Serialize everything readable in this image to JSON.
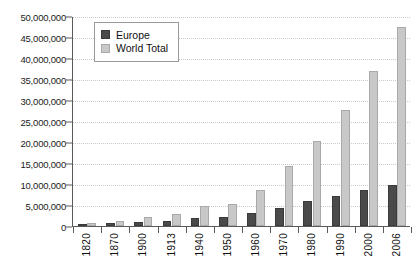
{
  "chart_data": {
    "type": "bar",
    "title": "",
    "subtitle": "",
    "xlabel": "",
    "ylabel": "",
    "ylim": [
      0,
      50000000
    ],
    "ytick_step": 5000000,
    "grid": true,
    "legend_position": "top-left",
    "categories": [
      "1820",
      "1870",
      "1900",
      "1913",
      "1940",
      "1950",
      "1960",
      "1970",
      "1980",
      "1990",
      "2000",
      "2006"
    ],
    "ytick_labels": [
      "50,000,000",
      "45,000,000",
      "40,000,000",
      "35,000,000",
      "30,000,000",
      "25,000,000",
      "20,000,000",
      "15,000,000",
      "10,000,000",
      "5,000,000",
      "0"
    ],
    "ytick_values": [
      50000000,
      45000000,
      40000000,
      35000000,
      30000000,
      25000000,
      20000000,
      15000000,
      10000000,
      5000000,
      0
    ],
    "series": [
      {
        "name": "Europe",
        "color": "#4a4a4a",
        "values": [
          300000,
          600000,
          1000000,
          1300000,
          1800000,
          2100000,
          3200000,
          4400000,
          5900000,
          7100000,
          8500000,
          9800000
        ]
      },
      {
        "name": "World Total",
        "color": "#c8c8c8",
        "values": [
          800000,
          1200000,
          2200000,
          2900000,
          4800000,
          5300000,
          8600000,
          14400000,
          20300000,
          27600000,
          36900000,
          47300000
        ]
      }
    ]
  },
  "legend": {
    "items": [
      {
        "label": "Europe",
        "color": "#4a4a4a"
      },
      {
        "label": "World Total",
        "color": "#c8c8c8"
      }
    ]
  },
  "colors": {
    "europe": "#4a4a4a",
    "world_total": "#c8c8c8",
    "axis": "#5a5a5a",
    "gridline": "#c9c9c9",
    "background": "#ffffff"
  }
}
